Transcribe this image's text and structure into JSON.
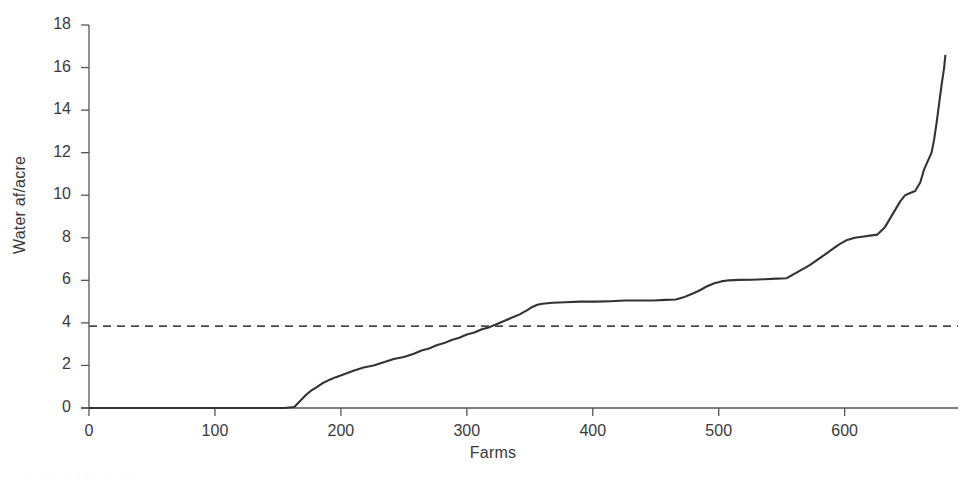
{
  "chart_data": {
    "type": "line",
    "title": "",
    "subtitle": "",
    "xlabel": "Farms",
    "ylabel": "Water af/acre",
    "xlim": [
      0,
      690
    ],
    "ylim": [
      0,
      18
    ],
    "xticks": [
      0,
      100,
      200,
      300,
      400,
      500,
      600
    ],
    "yticks": [
      0,
      2,
      4,
      6,
      8,
      10,
      12,
      14,
      16,
      18
    ],
    "grid": false,
    "legend": null,
    "series": [
      {
        "name": "Water applied per acre (sorted ascending)",
        "style": "solid",
        "color": "#333333",
        "x": [
          0,
          20,
          40,
          60,
          80,
          100,
          120,
          140,
          155,
          163,
          168,
          172,
          176,
          180,
          185,
          190,
          196,
          203,
          210,
          218,
          226,
          234,
          242,
          250,
          258,
          264,
          270,
          276,
          282,
          288,
          294,
          300,
          306,
          312,
          318,
          324,
          330,
          336,
          342,
          348,
          352,
          356,
          360,
          368,
          378,
          390,
          402,
          414,
          426,
          438,
          448,
          458,
          466,
          472,
          478,
          484,
          490,
          496,
          502,
          508,
          516,
          526,
          536,
          546,
          554,
          560,
          566,
          572,
          578,
          584,
          590,
          596,
          602,
          608,
          614,
          620,
          626,
          632,
          636,
          640,
          644,
          648,
          652,
          656,
          660,
          663,
          666,
          669,
          671,
          673,
          675,
          677,
          679,
          680
        ],
        "y": [
          0.0,
          0.0,
          0.0,
          0.0,
          0.0,
          0.0,
          0.0,
          0.0,
          0.0,
          0.05,
          0.35,
          0.6,
          0.8,
          0.95,
          1.15,
          1.3,
          1.45,
          1.6,
          1.75,
          1.9,
          2.0,
          2.15,
          2.3,
          2.4,
          2.55,
          2.7,
          2.8,
          2.95,
          3.05,
          3.2,
          3.3,
          3.45,
          3.55,
          3.7,
          3.8,
          3.95,
          4.1,
          4.25,
          4.4,
          4.6,
          4.75,
          4.85,
          4.9,
          4.95,
          4.97,
          5.0,
          5.0,
          5.02,
          5.05,
          5.05,
          5.05,
          5.08,
          5.1,
          5.2,
          5.35,
          5.5,
          5.7,
          5.85,
          5.95,
          6.0,
          6.02,
          6.03,
          6.05,
          6.08,
          6.1,
          6.3,
          6.5,
          6.7,
          6.95,
          7.2,
          7.45,
          7.7,
          7.9,
          8.0,
          8.05,
          8.1,
          8.15,
          8.5,
          8.9,
          9.3,
          9.7,
          10.0,
          10.1,
          10.2,
          10.6,
          11.2,
          11.6,
          12.0,
          12.6,
          13.4,
          14.3,
          15.2,
          16.0,
          16.6
        ]
      },
      {
        "name": "Reference level",
        "style": "dashed",
        "color": "#4a4a4a",
        "value": 3.85,
        "x": [
          0,
          690
        ],
        "y": [
          3.85,
          3.85
        ]
      }
    ],
    "annotations": []
  },
  "axes": {
    "ylabel": "Water af/acre",
    "xlabel": "Farms",
    "ytick_labels": [
      "0",
      "2",
      "4",
      "6",
      "8",
      "10",
      "12",
      "14",
      "16",
      "18"
    ],
    "xtick_labels": [
      "0",
      "100",
      "200",
      "300",
      "400",
      "500",
      "600"
    ]
  },
  "colors": {
    "curve": "#333333",
    "reference_line": "#4a4a4a",
    "axis": "#555555",
    "text": "#3a3a3a",
    "background": "#ffffff"
  },
  "bleed": {
    "text": "·   ·· ·  ···   ·    ··"
  }
}
